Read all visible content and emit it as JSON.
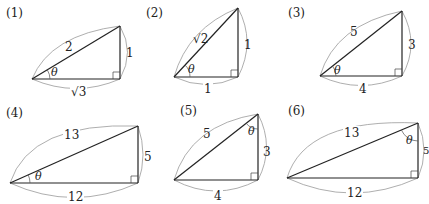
{
  "problems": [
    {
      "label": "(1)",
      "hyp": "2",
      "vertical": "1",
      "horizontal": "√3",
      "theta": "θ",
      "theta_position": "bottom-left"
    },
    {
      "label": "(2)",
      "hyp": "√2",
      "vertical": "1",
      "horizontal": "1",
      "theta": "θ",
      "theta_position": "bottom-left"
    },
    {
      "label": "(3)",
      "hyp": "5",
      "vertical": "3",
      "horizontal": "4",
      "theta": "θ",
      "theta_position": "bottom-left"
    },
    {
      "label": "(4)",
      "hyp": "13",
      "vertical": "5",
      "horizontal": "12",
      "theta": "θ",
      "theta_position": "bottom-left"
    },
    {
      "label": "(5)",
      "hyp": "5",
      "vertical": "3",
      "horizontal": "4",
      "theta": "θ",
      "theta_position": "top"
    },
    {
      "label": "(6)",
      "hyp": "13",
      "vertical": "5",
      "horizontal": "12",
      "theta": "θ",
      "theta_position": "top"
    }
  ]
}
